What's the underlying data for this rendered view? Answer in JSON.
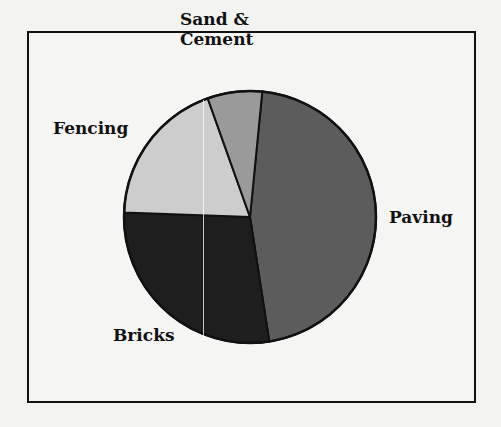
{
  "chart_data": {
    "type": "pie",
    "title": "",
    "start_angle_deg": 5.6,
    "direction": "clockwise",
    "slices": [
      {
        "label": "Paving",
        "value": 46,
        "color": "#5c5c5c"
      },
      {
        "label": "Bricks",
        "value": 28,
        "color": "#1e1e1e"
      },
      {
        "label": "Fencing",
        "value": 19,
        "color": "#cdcdcd"
      },
      {
        "label": "Sand & Cement",
        "value": 7,
        "color": "#9a9a9a"
      }
    ],
    "legend": "none (labels placed beside slices)"
  },
  "labels": {
    "sand_line1": "Sand &",
    "sand_line2": "Cement",
    "fencing": "Fencing",
    "paving": "Paving",
    "bricks": "Bricks"
  }
}
